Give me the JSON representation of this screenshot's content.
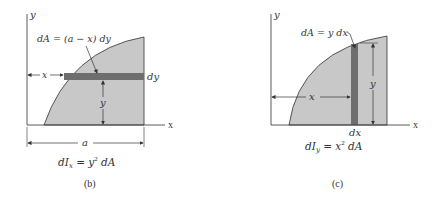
{
  "figures": [
    {
      "id": "b",
      "caption": "(b)",
      "axis_x": "x",
      "axis_y": "y",
      "element_label": "dA = (a − x) dy",
      "strip_thickness_label": "dy",
      "distance_x_label": "x",
      "distance_y_label": "y",
      "width_label": "a",
      "formula": {
        "left": "dI",
        "sub": "x",
        "right_pre": " = y",
        "sup": "2",
        "right_post": " dA"
      }
    },
    {
      "id": "c",
      "caption": "(c)",
      "axis_x": "x",
      "axis_y": "y",
      "element_label": "dA = y dx",
      "strip_thickness_label": "dx",
      "distance_x_label": "x",
      "distance_y_label": "y",
      "formula": {
        "left": "dI",
        "sub": "y",
        "right_pre": " = x",
        "sup": "2",
        "right_post": " dA"
      }
    }
  ],
  "colors": {
    "region_fill": "#c8c8c8",
    "strip_fill": "#6e6e6e",
    "line": "#333333"
  }
}
